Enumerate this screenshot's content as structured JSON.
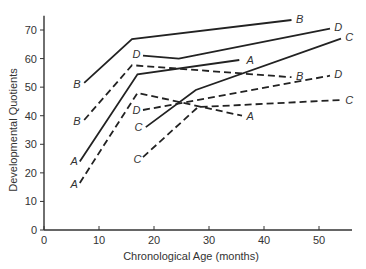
{
  "chart_data": {
    "type": "line",
    "title": "",
    "xlabel": "Chronological Age (months)",
    "ylabel": "Developmental Quotients",
    "xlim": [
      0,
      56
    ],
    "ylim": [
      0,
      75
    ],
    "xticks": [
      0,
      10,
      20,
      30,
      40,
      50
    ],
    "yticks": [
      0,
      10,
      20,
      30,
      40,
      50,
      60,
      70
    ],
    "grid": false,
    "legend": "none (series labeled inline at line ends with letters A-D; solid vs dashed lines)",
    "series": [
      {
        "name": "A",
        "style": "solid",
        "points": [
          [
            6.5,
            24
          ],
          [
            17,
            54.5
          ],
          [
            35.5,
            59.5
          ]
        ]
      },
      {
        "name": "A",
        "style": "dashed",
        "points": [
          [
            6.5,
            16.5
          ],
          [
            17,
            48
          ],
          [
            36,
            40
          ]
        ]
      },
      {
        "name": "B",
        "style": "solid",
        "points": [
          [
            7.3,
            51.5
          ],
          [
            16,
            66.8
          ],
          [
            45,
            73.5
          ]
        ]
      },
      {
        "name": "B",
        "style": "dashed",
        "points": [
          [
            7.3,
            38.5
          ],
          [
            16,
            57.7
          ],
          [
            45,
            53.5
          ]
        ]
      },
      {
        "name": "C",
        "style": "solid",
        "points": [
          [
            18.5,
            36
          ],
          [
            27.6,
            49
          ],
          [
            54,
            67
          ]
        ]
      },
      {
        "name": "C",
        "style": "dashed",
        "points": [
          [
            18,
            25.5
          ],
          [
            28,
            43
          ],
          [
            54,
            45.5
          ]
        ]
      },
      {
        "name": "D",
        "style": "solid",
        "points": [
          [
            18,
            61
          ],
          [
            24.5,
            60
          ],
          [
            52,
            70.5
          ]
        ]
      },
      {
        "name": "D",
        "style": "dashed",
        "points": [
          [
            18,
            42
          ],
          [
            52,
            54
          ]
        ]
      }
    ],
    "labels": [
      {
        "text": "A",
        "x": 5.5,
        "y": 24
      },
      {
        "text": "A",
        "x": 5.5,
        "y": 16
      },
      {
        "text": "A",
        "x": 37.5,
        "y": 59.5
      },
      {
        "text": "A",
        "x": 37.5,
        "y": 40
      },
      {
        "text": "B",
        "x": 6,
        "y": 51
      },
      {
        "text": "B",
        "x": 6,
        "y": 38
      },
      {
        "text": "B",
        "x": 46.5,
        "y": 74
      },
      {
        "text": "B",
        "x": 46.5,
        "y": 54
      },
      {
        "text": "C",
        "x": 17.2,
        "y": 36
      },
      {
        "text": "C",
        "x": 17,
        "y": 25
      },
      {
        "text": "C",
        "x": 55.5,
        "y": 67.5
      },
      {
        "text": "C",
        "x": 55.5,
        "y": 45.5
      },
      {
        "text": "D",
        "x": 16.8,
        "y": 61.5
      },
      {
        "text": "D",
        "x": 16.8,
        "y": 42
      },
      {
        "text": "D",
        "x": 53.5,
        "y": 71
      },
      {
        "text": "D",
        "x": 53.5,
        "y": 54.5
      }
    ]
  }
}
